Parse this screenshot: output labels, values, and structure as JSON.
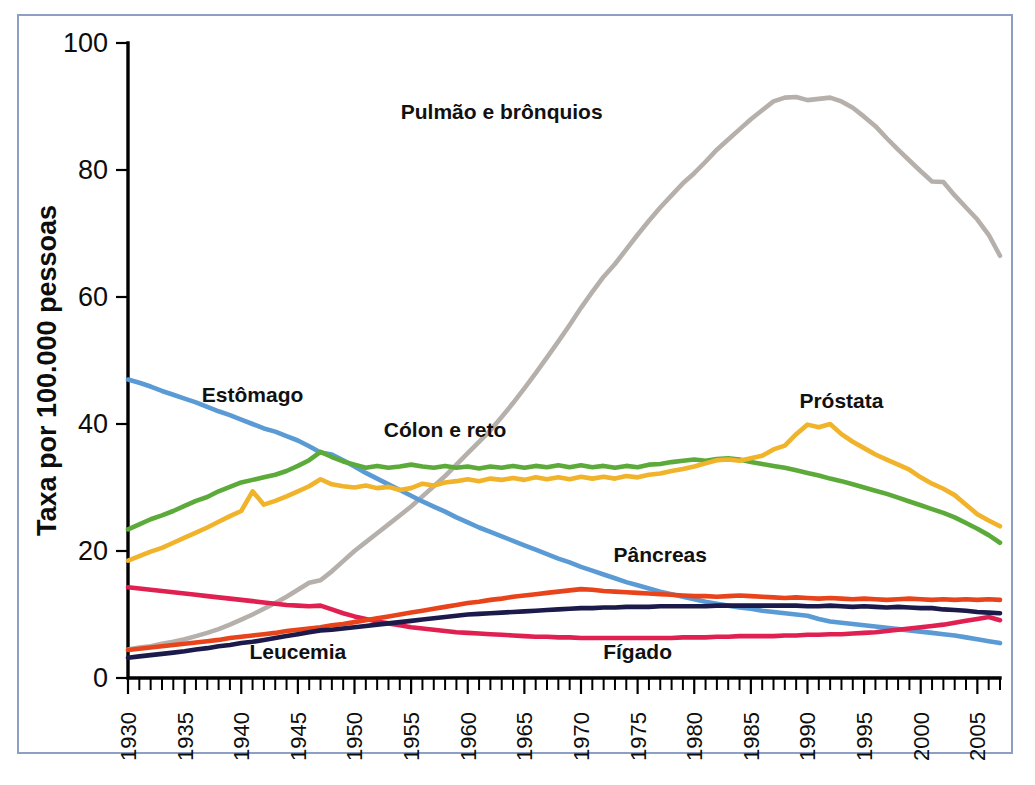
{
  "figure": {
    "border_color": "#8e9fc4",
    "background": "#ffffff"
  },
  "chart_data": {
    "type": "line",
    "title": "",
    "subtitle": "",
    "xlabel": "",
    "ylabel": "Taxa por 100.000 pessoas",
    "xlim": [
      1930,
      2007
    ],
    "ylim": [
      0,
      100
    ],
    "grid": false,
    "legend_position": "inline-annotations",
    "y_ticks": [
      0,
      20,
      40,
      60,
      80,
      100
    ],
    "y_tick_labels": [
      "0",
      "20",
      "40",
      "60",
      "80",
      "100"
    ],
    "x_ticks": [
      1930,
      1935,
      1940,
      1945,
      1950,
      1955,
      1960,
      1965,
      1970,
      1975,
      1980,
      1985,
      1990,
      1995,
      2000,
      2005
    ],
    "x_tick_labels": [
      "1930",
      "1935",
      "1940",
      "1945",
      "1950",
      "1955",
      "1960",
      "1965",
      "1970",
      "1975",
      "1980",
      "1985",
      "1990",
      "1995",
      "2000",
      "2005"
    ],
    "x_minor_tick_step": 1,
    "x": [
      1930,
      1931,
      1932,
      1933,
      1934,
      1935,
      1936,
      1937,
      1938,
      1939,
      1940,
      1941,
      1942,
      1943,
      1944,
      1945,
      1946,
      1947,
      1948,
      1949,
      1950,
      1951,
      1952,
      1953,
      1954,
      1955,
      1956,
      1957,
      1958,
      1959,
      1960,
      1961,
      1962,
      1963,
      1964,
      1965,
      1966,
      1967,
      1968,
      1969,
      1970,
      1971,
      1972,
      1973,
      1974,
      1975,
      1976,
      1977,
      1978,
      1979,
      1980,
      1981,
      1982,
      1983,
      1984,
      1985,
      1986,
      1987,
      1988,
      1989,
      1990,
      1991,
      1992,
      1993,
      1994,
      1995,
      1996,
      1997,
      1998,
      1999,
      2000,
      2001,
      2002,
      2003,
      2004,
      2005,
      2006,
      2007
    ],
    "series": [
      {
        "name": "Pulmão e brônquios",
        "label": "Pulmão e brônquios",
        "color": "#b5b0ab",
        "label_x": 1963,
        "label_y": 88,
        "values": [
          4.5,
          4.8,
          5.0,
          5.4,
          5.7,
          6.1,
          6.6,
          7.1,
          7.7,
          8.4,
          9.2,
          10.0,
          10.9,
          11.8,
          12.8,
          13.9,
          15.0,
          15.4,
          16.8,
          18.4,
          20.0,
          21.4,
          22.8,
          24.2,
          25.6,
          27.0,
          28.6,
          30.2,
          31.8,
          33.6,
          35.4,
          37.2,
          39.0,
          41.1,
          43.3,
          45.6,
          48.0,
          50.5,
          53.0,
          55.6,
          58.3,
          60.8,
          63.2,
          65.2,
          67.5,
          69.8,
          72.0,
          74.1,
          76.0,
          77.9,
          79.5,
          81.3,
          83.2,
          84.8,
          86.4,
          88.0,
          89.4,
          90.8,
          91.4,
          91.5,
          91.0,
          91.2,
          91.4,
          90.8,
          89.8,
          88.4,
          86.9,
          85.0,
          83.2,
          81.5,
          79.8,
          78.2,
          78.1,
          76.0,
          74.1,
          72.2,
          69.8,
          66.5
        ]
      },
      {
        "name": "Estômago",
        "label": "Estômago",
        "color": "#5b9bd5",
        "label_x": 1941,
        "label_y": 43.5,
        "values": [
          47.0,
          46.5,
          45.9,
          45.2,
          44.6,
          44.0,
          43.4,
          42.7,
          42.0,
          41.4,
          40.7,
          40.0,
          39.3,
          38.8,
          38.1,
          37.4,
          36.5,
          35.5,
          35.2,
          34.3,
          33.3,
          32.3,
          31.4,
          30.5,
          29.6,
          28.7,
          27.8,
          27.0,
          26.2,
          25.3,
          24.5,
          23.7,
          23.0,
          22.3,
          21.6,
          20.9,
          20.2,
          19.5,
          18.8,
          18.2,
          17.5,
          16.9,
          16.3,
          15.7,
          15.1,
          14.6,
          14.1,
          13.6,
          13.2,
          12.8,
          12.4,
          12.0,
          11.7,
          11.4,
          11.1,
          10.9,
          10.6,
          10.4,
          10.2,
          10.0,
          9.8,
          9.3,
          8.9,
          8.7,
          8.5,
          8.3,
          8.1,
          7.9,
          7.7,
          7.5,
          7.3,
          7.1,
          6.9,
          6.7,
          6.4,
          6.1,
          5.8,
          5.5
        ]
      },
      {
        "name": "Cólon e reto",
        "label": "Cólon e reto",
        "color": "#5cab3a",
        "label_x": 1958,
        "label_y": 38,
        "values": [
          23.4,
          24.2,
          25.0,
          25.6,
          26.3,
          27.1,
          27.9,
          28.5,
          29.4,
          30.1,
          30.8,
          31.2,
          31.6,
          32.0,
          32.6,
          33.4,
          34.3,
          35.6,
          34.8,
          34.1,
          33.6,
          33.1,
          33.4,
          33.1,
          33.3,
          33.6,
          33.3,
          33.1,
          33.4,
          33.1,
          33.3,
          33.0,
          33.3,
          33.1,
          33.4,
          33.1,
          33.4,
          33.2,
          33.5,
          33.2,
          33.5,
          33.2,
          33.4,
          33.1,
          33.4,
          33.2,
          33.6,
          33.7,
          34.0,
          34.2,
          34.4,
          34.2,
          34.5,
          34.6,
          34.4,
          34.0,
          33.7,
          33.4,
          33.1,
          32.7,
          32.3,
          31.9,
          31.4,
          31.0,
          30.5,
          30.0,
          29.5,
          29.0,
          28.4,
          27.8,
          27.2,
          26.6,
          26.0,
          25.3,
          24.4,
          23.5,
          22.5,
          21.3
        ]
      },
      {
        "name": "Próstata",
        "label": "Próstata",
        "color": "#f0b32a",
        "label_x": 1993,
        "label_y": 42.5,
        "values": [
          18.5,
          19.2,
          19.9,
          20.5,
          21.3,
          22.1,
          22.9,
          23.7,
          24.6,
          25.5,
          26.3,
          29.4,
          27.3,
          27.9,
          28.6,
          29.4,
          30.2,
          31.3,
          30.5,
          30.2,
          30.0,
          30.3,
          29.9,
          30.1,
          29.6,
          29.9,
          30.6,
          30.3,
          30.8,
          31.0,
          31.3,
          31.0,
          31.4,
          31.2,
          31.5,
          31.2,
          31.6,
          31.3,
          31.6,
          31.3,
          31.7,
          31.4,
          31.7,
          31.4,
          31.8,
          31.6,
          32.0,
          32.2,
          32.6,
          32.9,
          33.3,
          33.8,
          34.3,
          34.4,
          34.2,
          34.6,
          35.0,
          36.0,
          36.6,
          38.4,
          39.9,
          39.5,
          40.0,
          38.4,
          37.2,
          36.2,
          35.2,
          34.4,
          33.6,
          32.8,
          31.6,
          30.6,
          29.8,
          28.8,
          27.3,
          25.8,
          24.8,
          23.9
        ]
      },
      {
        "name": "Pâncreas",
        "label": "Pâncreas",
        "color": "#e8431a",
        "label_x": 1977,
        "label_y": 18.3,
        "values": [
          4.4,
          4.6,
          4.8,
          5.0,
          5.2,
          5.4,
          5.6,
          5.8,
          6.0,
          6.3,
          6.5,
          6.7,
          6.9,
          7.1,
          7.4,
          7.6,
          7.8,
          8.0,
          8.3,
          8.5,
          8.8,
          9.1,
          9.4,
          9.7,
          10.0,
          10.3,
          10.6,
          10.9,
          11.2,
          11.5,
          11.8,
          12.0,
          12.3,
          12.5,
          12.8,
          13.0,
          13.2,
          13.4,
          13.6,
          13.8,
          14.0,
          13.9,
          13.7,
          13.6,
          13.5,
          13.4,
          13.3,
          13.2,
          13.1,
          13.0,
          12.9,
          12.9,
          12.8,
          12.9,
          13.0,
          12.9,
          12.8,
          12.7,
          12.6,
          12.7,
          12.6,
          12.5,
          12.6,
          12.5,
          12.4,
          12.5,
          12.4,
          12.3,
          12.4,
          12.5,
          12.4,
          12.3,
          12.4,
          12.3,
          12.4,
          12.3,
          12.4,
          12.3
        ]
      },
      {
        "name": "Leucemia",
        "label": "Leucemia",
        "color": "#1b1a4a",
        "label_x": 1945,
        "label_y": 3.0,
        "values": [
          3.2,
          3.4,
          3.6,
          3.8,
          4.0,
          4.2,
          4.5,
          4.7,
          5.0,
          5.2,
          5.5,
          5.7,
          6.0,
          6.3,
          6.6,
          6.9,
          7.2,
          7.5,
          7.6,
          7.8,
          8.0,
          8.2,
          8.4,
          8.6,
          8.8,
          9.0,
          9.2,
          9.4,
          9.6,
          9.8,
          10.0,
          10.1,
          10.2,
          10.3,
          10.4,
          10.5,
          10.6,
          10.7,
          10.8,
          10.9,
          11.0,
          11.0,
          11.1,
          11.1,
          11.2,
          11.2,
          11.2,
          11.3,
          11.3,
          11.3,
          11.3,
          11.3,
          11.4,
          11.4,
          11.4,
          11.4,
          11.4,
          11.4,
          11.4,
          11.4,
          11.3,
          11.3,
          11.4,
          11.3,
          11.2,
          11.3,
          11.2,
          11.1,
          11.2,
          11.1,
          11.0,
          11.0,
          10.8,
          10.7,
          10.6,
          10.4,
          10.3,
          10.2
        ]
      },
      {
        "name": "Fígado",
        "label": "Fígado",
        "color": "#e02050",
        "label_x": 1975,
        "label_y": 3.0,
        "values": [
          14.3,
          14.1,
          13.9,
          13.7,
          13.5,
          13.3,
          13.1,
          12.9,
          12.7,
          12.5,
          12.3,
          12.1,
          11.9,
          11.7,
          11.5,
          11.4,
          11.3,
          11.4,
          10.8,
          10.2,
          9.7,
          9.3,
          8.9,
          8.6,
          8.3,
          8.0,
          7.8,
          7.6,
          7.4,
          7.2,
          7.1,
          7.0,
          6.9,
          6.8,
          6.7,
          6.6,
          6.5,
          6.5,
          6.4,
          6.4,
          6.3,
          6.3,
          6.3,
          6.3,
          6.3,
          6.3,
          6.3,
          6.3,
          6.3,
          6.4,
          6.4,
          6.4,
          6.5,
          6.5,
          6.6,
          6.6,
          6.6,
          6.6,
          6.7,
          6.7,
          6.8,
          6.8,
          6.9,
          6.9,
          7.0,
          7.1,
          7.2,
          7.4,
          7.6,
          7.8,
          8.0,
          8.2,
          8.4,
          8.7,
          9.0,
          9.3,
          9.6,
          9.1
        ]
      }
    ]
  }
}
